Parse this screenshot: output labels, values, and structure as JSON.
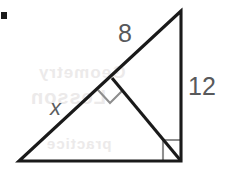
{
  "figure": {
    "background_color": "#ffffff",
    "stroke_color": "#1a1a1a",
    "mark_color": "#8c8c8c",
    "label_color": "#58595b",
    "labels": [
      {
        "id": "segment-8",
        "text": "8",
        "meaning": "upper hypotenuse segment length",
        "x": 118,
        "y": 21
      },
      {
        "id": "leg-12",
        "text": "12",
        "meaning": "vertical leg length",
        "x": 188,
        "y": 74
      },
      {
        "id": "segment-x",
        "text": "x",
        "meaning": "lower hypotenuse segment, unknown",
        "x": 50,
        "y": 97,
        "italic": true
      }
    ],
    "vertices": {
      "apex": {
        "x": 181,
        "y": 11
      },
      "bottom_left": {
        "x": 19,
        "y": 161
      },
      "bottom_right": {
        "x": 181,
        "y": 161
      },
      "altitude_foot": {
        "x": 112,
        "y": 78
      }
    },
    "right_angle_marks": [
      {
        "id": "altitude-foot-right-angle",
        "style": "rotated-square",
        "center": {
          "x": 110,
          "y": 91
        }
      },
      {
        "id": "bottom-right-angle",
        "style": "axis-aligned-square",
        "corner": {
          "x": 181,
          "y": 161
        },
        "size": 18
      }
    ],
    "ghost_text": [
      {
        "text": "Geometry",
        "x": 38,
        "y": 63
      },
      {
        "text": "Lesson",
        "x": 30,
        "y": 86
      },
      {
        "text": "practice",
        "x": 46,
        "y": 135
      }
    ],
    "corner_mark": {
      "x": 1,
      "y": 12,
      "width": 6,
      "height": 7
    }
  }
}
